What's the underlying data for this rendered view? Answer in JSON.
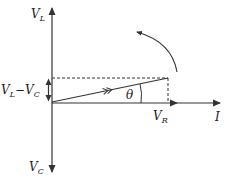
{
  "diagram": {
    "type": "phasor-diagram",
    "colors": {
      "line": "#333333",
      "text": "#222222",
      "background": "#ffffff"
    },
    "labels": {
      "vl": {
        "main": "V",
        "sub": "L"
      },
      "vc": {
        "main": "V",
        "sub": "C"
      },
      "vl_minus_vc": {
        "main1": "V",
        "sub1": "L",
        "minus": "−",
        "main2": "V",
        "sub2": "C"
      },
      "vr": {
        "main": "V",
        "sub": "R"
      },
      "current": "I",
      "angle": "θ"
    },
    "elements": [
      "vertical-axis-vl-up",
      "vertical-axis-vc-down",
      "horizontal-current-axis",
      "vr-phasor",
      "resultant-phasor",
      "dashed-projection-horizontal",
      "dashed-projection-vertical",
      "vl-minus-vc-double-arrow",
      "theta-angle-arc",
      "rotation-direction-arrow"
    ]
  }
}
